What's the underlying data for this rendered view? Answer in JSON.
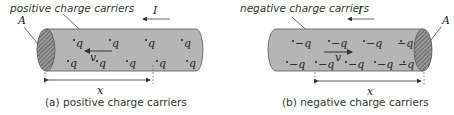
{
  "figure": {
    "panel_a": {
      "title_label": "positive charge carriers",
      "current_label": "I",
      "area_label": "A",
      "velocity_label": "v",
      "length_label": "x",
      "caption": "(a) positive charge carriers",
      "carrier_label": "q",
      "carriers_top": [
        "q",
        "q",
        "q",
        "q"
      ],
      "carriers_bottom": [
        "q",
        "q",
        "q",
        "q",
        "q"
      ]
    },
    "panel_b": {
      "title_label": "negative charge carriers",
      "current_label": "I",
      "area_label": "A",
      "velocity_label": "v",
      "length_label": "x",
      "caption": "(b) negative charge carriers",
      "carrier_label": "−q",
      "carriers_top": [
        "−q",
        "−q",
        "−q",
        "−q"
      ],
      "carriers_bottom": [
        "−q",
        "−q",
        "−q",
        "−q",
        "−q"
      ]
    },
    "colors": {
      "conductor_fill": "#b5b5b5",
      "conductor_edge": "#555555",
      "text": "#333333"
    }
  }
}
